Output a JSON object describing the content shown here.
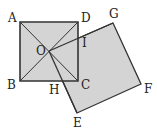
{
  "diagram": {
    "fill_color": "#d4d4d4",
    "stroke_color": "#333333",
    "points": {
      "A": {
        "label": "A",
        "x": 20,
        "y": 22
      },
      "B": {
        "label": "B",
        "x": 20,
        "y": 81
      },
      "C": {
        "label": "C",
        "x": 78,
        "y": 81
      },
      "D": {
        "label": "D",
        "x": 78,
        "y": 22
      },
      "O": {
        "label": "O",
        "x": 49,
        "y": 51
      },
      "G": {
        "label": "G",
        "x": 113,
        "y": 23
      },
      "F": {
        "label": "F",
        "x": 141,
        "y": 84
      },
      "E": {
        "label": "E",
        "x": 77,
        "y": 113
      },
      "I": {
        "label": "I",
        "x": 78,
        "y": 38
      },
      "H": {
        "label": "H",
        "x": 63,
        "y": 81
      }
    },
    "shapes": [
      {
        "name": "square-ABCD",
        "vertices": [
          "A",
          "D",
          "C",
          "B"
        ]
      },
      {
        "name": "square-OGFE",
        "vertices": [
          "O",
          "G",
          "F",
          "E"
        ]
      }
    ],
    "segments": [
      [
        "A",
        "C"
      ],
      [
        "B",
        "D"
      ],
      [
        "O",
        "G"
      ],
      [
        "O",
        "E"
      ]
    ]
  }
}
